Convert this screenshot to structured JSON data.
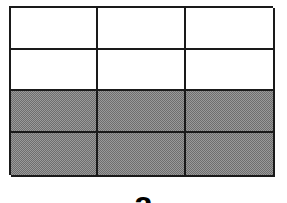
{
  "figure": {
    "type": "fraction-grid",
    "rows": 4,
    "columns": 3,
    "total_cells": 12,
    "shaded_cells": 6,
    "shaded_rows": [
      3,
      4
    ],
    "shaded_fraction": "6/12",
    "colors": {
      "border": "#1a1a1a",
      "unshaded": "#ffffff",
      "shaded": "#8a8a8a"
    },
    "cells": [
      {
        "row": 1,
        "col": 1,
        "shaded": false
      },
      {
        "row": 1,
        "col": 2,
        "shaded": false
      },
      {
        "row": 1,
        "col": 3,
        "shaded": false
      },
      {
        "row": 2,
        "col": 1,
        "shaded": false
      },
      {
        "row": 2,
        "col": 2,
        "shaded": false
      },
      {
        "row": 2,
        "col": 3,
        "shaded": false
      },
      {
        "row": 3,
        "col": 1,
        "shaded": true
      },
      {
        "row": 3,
        "col": 2,
        "shaded": true
      },
      {
        "row": 3,
        "col": 3,
        "shaded": true
      },
      {
        "row": 4,
        "col": 1,
        "shaded": true
      },
      {
        "row": 4,
        "col": 2,
        "shaded": true
      },
      {
        "row": 4,
        "col": 3,
        "shaded": true
      }
    ]
  },
  "caption": {
    "label": "a"
  }
}
